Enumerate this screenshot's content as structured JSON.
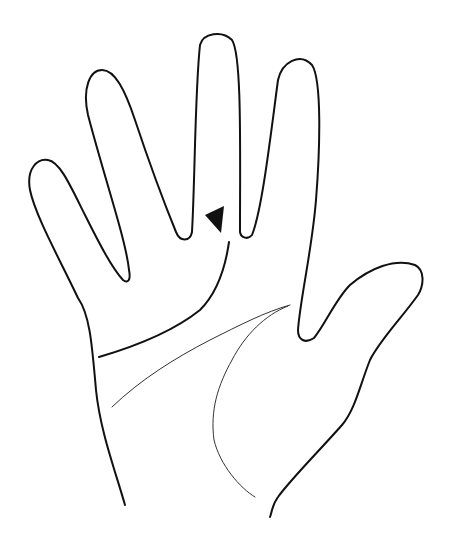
{
  "diagram": {
    "colors": {
      "line": "#111111",
      "background": "#ffffff"
    },
    "elements": [
      {
        "name": "hand-outline"
      },
      {
        "name": "heart-line"
      },
      {
        "name": "head-line"
      },
      {
        "name": "life-line"
      },
      {
        "name": "arrow-marker",
        "points_to": "heart-line-end"
      }
    ]
  }
}
